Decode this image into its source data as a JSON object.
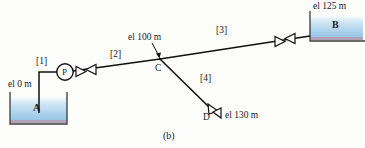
{
  "figure": {
    "caption": "(b)",
    "type": "piping-network-schematic"
  },
  "reservoirs": [
    {
      "id": "A",
      "name": "A",
      "elevation_label": "el 0 m",
      "elevation_m": 0
    },
    {
      "id": "B",
      "name": "B",
      "elevation_label": "el 125 m",
      "elevation_m": 125
    }
  ],
  "nodes": [
    {
      "id": "C",
      "name": "C",
      "elevation_label": "el 100 m",
      "elevation_m": 100
    },
    {
      "id": "D",
      "name": "D",
      "elevation_label": "el 130 m",
      "elevation_m": 130
    }
  ],
  "pump": {
    "name": "P",
    "label": "P"
  },
  "pipes": [
    {
      "id": "1",
      "label": "[1]",
      "from": "A",
      "to": "P"
    },
    {
      "id": "2",
      "label": "[2]",
      "from": "P",
      "to": "C"
    },
    {
      "id": "3",
      "label": "[3]",
      "from": "C",
      "to": "B"
    },
    {
      "id": "4",
      "label": "[4]",
      "from": "C",
      "to": "D"
    }
  ],
  "valves": [
    {
      "id": "valve-pipe-2",
      "on_pipe": "2"
    },
    {
      "id": "valve-pipe-3",
      "on_pipe": "3"
    },
    {
      "id": "valve-pipe-4",
      "on_pipe": "4"
    }
  ],
  "colors": {
    "line": "#111111",
    "water_top": "#ffffff",
    "water_mid": "#a9cfe8",
    "water_bottom": "#7fb8dd",
    "tank_edge": "#3a3a3a",
    "tank_base": "#b2a2b8",
    "background": "#fdfdfc"
  }
}
